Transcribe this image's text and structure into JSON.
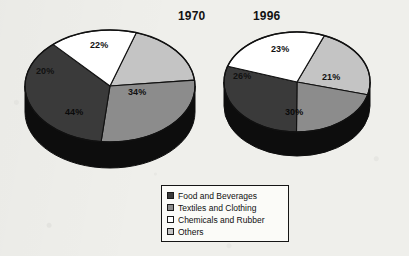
{
  "figure": {
    "background_color": "#efefeb",
    "ink_color": "#111111"
  },
  "legend": {
    "name": "legend-box",
    "items": [
      {
        "label": "Food and Beverages",
        "color": "#3a3a3a",
        "key": "food"
      },
      {
        "label": "Textiles and Clothing",
        "color": "#8c8c8c",
        "key": "textiles"
      },
      {
        "label": "Chemicals and Rubber",
        "color": "#ffffff",
        "key": "chemicals"
      },
      {
        "label": "Others",
        "color": "#c4c4c4",
        "key": "others"
      }
    ]
  },
  "charts": [
    {
      "title": "1970",
      "title_left": 178,
      "title_top": 9,
      "center_x": 110,
      "center_y": 86,
      "radius_x": 85,
      "radius_y": 56,
      "depth": 26,
      "start_angle": -72,
      "labels": [
        {
          "text": "22%",
          "left": 90,
          "top": 40
        },
        {
          "text": "34%",
          "left": 128,
          "top": 87
        },
        {
          "text": "44%",
          "left": 65,
          "top": 107
        },
        {
          "text": "20%",
          "left": 36,
          "top": 66
        }
      ]
    },
    {
      "title": "1996",
      "title_left": 253,
      "title_top": 9,
      "center_x": 297,
      "center_y": 82,
      "radius_x": 73,
      "radius_y": 50,
      "depth": 24,
      "start_angle": -68,
      "labels": [
        {
          "text": "23%",
          "left": 271,
          "top": 44
        },
        {
          "text": "21%",
          "left": 322,
          "top": 72
        },
        {
          "text": "30%",
          "left": 285,
          "top": 107
        },
        {
          "text": "26%",
          "left": 233,
          "top": 71
        }
      ]
    }
  ],
  "chart_data": {
    "type": "pie",
    "categories": [
      "Others",
      "Textiles and Clothing",
      "Food and Beverages",
      "Chemicals and Rubber"
    ],
    "colors": {
      "Food and Beverages": "#3a3a3a",
      "Textiles and Clothing": "#8c8c8c",
      "Chemicals and Rubber": "#ffffff",
      "Others": "#c4c4c4"
    },
    "units": "percent",
    "legend_position": "bottom-center",
    "grid": false,
    "series": [
      {
        "name": "1970",
        "slices": [
          {
            "label": "Others",
            "value": 22,
            "display": "22%",
            "color": "#c4c4c4"
          },
          {
            "label": "Textiles and Clothing",
            "value": 34,
            "display": "34%",
            "color": "#8c8c8c"
          },
          {
            "label": "Food and Beverages",
            "value": 44,
            "display": "44%",
            "color": "#3a3a3a"
          },
          {
            "label": "Chemicals and Rubber",
            "value": 20,
            "display": "20%",
            "color": "#ffffff"
          }
        ]
      },
      {
        "name": "1996",
        "slices": [
          {
            "label": "Others",
            "value": 23,
            "display": "23%",
            "color": "#c4c4c4"
          },
          {
            "label": "Textiles and Clothing",
            "value": 21,
            "display": "21%",
            "color": "#8c8c8c"
          },
          {
            "label": "Food and Beverages",
            "value": 30,
            "display": "30%",
            "color": "#3a3a3a"
          },
          {
            "label": "Chemicals and Rubber",
            "value": 26,
            "display": "26%",
            "color": "#ffffff"
          }
        ]
      }
    ]
  }
}
